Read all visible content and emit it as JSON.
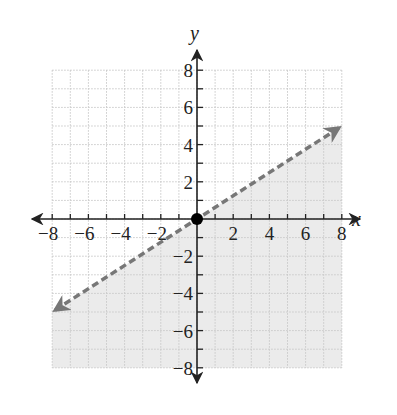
{
  "chart_data": {
    "type": "line",
    "title": "",
    "xlabel": "x",
    "ylabel": "y",
    "xlim": [
      -8,
      8
    ],
    "ylim": [
      -8,
      8
    ],
    "grid": true,
    "x_ticks": [
      -8,
      -6,
      -4,
      -2,
      2,
      4,
      6,
      8
    ],
    "y_ticks": [
      8,
      6,
      4,
      2,
      -2,
      -4,
      -6,
      -8
    ],
    "x_tick_labels": [
      "−8",
      "−6",
      "−4",
      "−2",
      "2",
      "4",
      "6",
      "8"
    ],
    "y_tick_labels": [
      "8",
      "6",
      "4",
      "2",
      "−2",
      "−4",
      "−6",
      "−8"
    ],
    "series": [
      {
        "name": "boundary line y = (5/8)x",
        "style": "dashed",
        "arrows": "both",
        "color": "#777777",
        "x": [
          -8,
          8
        ],
        "y": [
          -5,
          5
        ]
      }
    ],
    "points": [
      {
        "x": 0,
        "y": 0,
        "style": "closed-dot",
        "color": "#000000"
      }
    ],
    "shaded_region": {
      "description": "region below the dashed line",
      "inequality": "y < (5/8)x",
      "color": "#ebebeb"
    }
  },
  "labels": {
    "x_axis": "x",
    "y_axis": "y"
  },
  "colors": {
    "shade": "#ebebeb",
    "grid": "#c8c8c8",
    "axis": "#222222",
    "line": "#777777",
    "dot": "#000000"
  }
}
